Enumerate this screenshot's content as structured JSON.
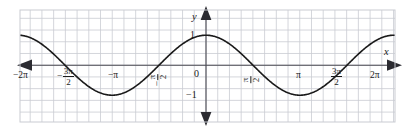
{
  "figure": {
    "kind": "coordinate-grid-graph",
    "background_color": "#ffffff",
    "grid_color": "#c9cbd2",
    "axis_color": "#4a4a52",
    "curve_color": "#1a1a1a",
    "label_color": "#1a1a1a"
  },
  "axes": {
    "x_axis_label": "x",
    "y_axis_label": "y",
    "origin_label": "0",
    "x_ticks": [
      {
        "label": "−2π",
        "value": -6.283185,
        "style": "inline"
      },
      {
        "label": "−3π/2",
        "value": -4.712389,
        "style": "fraction",
        "sign": "−",
        "numerator": "3π",
        "denominator": "2"
      },
      {
        "label": "−π",
        "value": -3.141593,
        "style": "inline"
      },
      {
        "label": "−π/2",
        "value": -1.570796,
        "style": "fraction-rotated",
        "sign": "−",
        "numerator": "π",
        "denominator": "2"
      },
      {
        "label": "π/2",
        "value": 1.570796,
        "style": "fraction-rotated",
        "sign": "",
        "numerator": "π",
        "denominator": "2"
      },
      {
        "label": "π",
        "value": 3.141593,
        "style": "inline"
      },
      {
        "label": "3π/2",
        "value": 4.712389,
        "style": "fraction",
        "sign": "",
        "numerator": "3π",
        "denominator": "2"
      },
      {
        "label": "2π",
        "value": 6.283185,
        "style": "inline"
      }
    ],
    "y_ticks": [
      {
        "label": "1",
        "value": 1
      },
      {
        "label": "−1",
        "value": -1
      }
    ],
    "x_range": [
      -6.9,
      6.9
    ],
    "y_range": [
      -1.9,
      1.9
    ],
    "grid": true,
    "arrowheads": [
      "left",
      "right",
      "up",
      "down"
    ]
  },
  "chart_data": {
    "type": "line",
    "title": "",
    "subtitle": "",
    "xlabel": "x",
    "ylabel": "y",
    "xlim": [
      -6.9,
      6.9
    ],
    "ylim": [
      -1.9,
      1.9
    ],
    "grid": true,
    "legend": null,
    "series": [
      {
        "name": "y = cos x",
        "equation": "cos(x)",
        "amplitude": 1,
        "period": 6.283185,
        "phase": 0,
        "color": "#1a1a1a",
        "key_points": [
          {
            "x": -6.283185,
            "y": 1,
            "kind": "maximum"
          },
          {
            "x": -4.712389,
            "y": 0,
            "kind": "zero"
          },
          {
            "x": -3.141593,
            "y": -1,
            "kind": "minimum"
          },
          {
            "x": -1.570796,
            "y": 0,
            "kind": "zero"
          },
          {
            "x": 0,
            "y": 1,
            "kind": "maximum"
          },
          {
            "x": 1.570796,
            "y": 0,
            "kind": "zero"
          },
          {
            "x": 3.141593,
            "y": -1,
            "kind": "minimum"
          },
          {
            "x": 4.712389,
            "y": 0,
            "kind": "zero"
          },
          {
            "x": 6.283185,
            "y": 1,
            "kind": "maximum"
          }
        ]
      }
    ]
  }
}
